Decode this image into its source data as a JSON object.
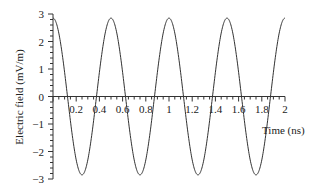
{
  "chart_data": {
    "type": "line",
    "title": "",
    "xlabel": "Time (ns)",
    "ylabel": "Electric field (mV/m)",
    "xlim": [
      0,
      2
    ],
    "ylim": [
      -3,
      3
    ],
    "x_ticks": [
      "0.2",
      "0.4",
      "0.6",
      "0.8",
      "1",
      "1.2",
      "1.4",
      "1.6",
      "1.8",
      "2"
    ],
    "y_ticks": [
      "3",
      "2",
      "1",
      "0",
      "-1",
      "-2",
      "-3"
    ],
    "grid": false,
    "legend": null,
    "series": [
      {
        "name": "Electric field",
        "function": "2.85*cos(2*pi*t/0.5)",
        "amplitude": 2.85,
        "period_ns": 0.5,
        "x": [
          0,
          0.125,
          0.25,
          0.375,
          0.5,
          0.625,
          0.75,
          0.875,
          1.0,
          1.125,
          1.25,
          1.375,
          1.5,
          1.625,
          1.75,
          1.875,
          2.0
        ],
        "values": [
          2.85,
          0,
          -2.85,
          0,
          2.85,
          0,
          -2.85,
          0,
          2.85,
          0,
          -2.85,
          0,
          2.85,
          0,
          -2.85,
          0,
          2.85
        ]
      }
    ]
  }
}
